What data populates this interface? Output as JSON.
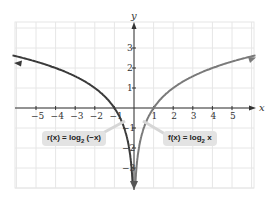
{
  "chart_data": {
    "type": "line",
    "title": "",
    "xlabel": "x",
    "ylabel": "y",
    "xlim": [
      -5.5,
      6
    ],
    "ylim": [
      -4,
      4.3
    ],
    "grid": true,
    "x_ticks": [
      -5,
      -4,
      -3,
      -2,
      -1,
      1,
      2,
      3,
      4,
      5
    ],
    "y_ticks": [
      -3,
      -2,
      -1,
      1,
      2,
      3
    ],
    "series": [
      {
        "name": "r(x) = log2(-x)",
        "label_text": "r(x) = log",
        "label_base": "2",
        "label_arg": " (−x)",
        "color": "#3a3a3a",
        "x": [
          -6.2,
          -5,
          -4,
          -3,
          -2,
          -1,
          -0.5,
          -0.25,
          -0.125,
          -0.08
        ],
        "y": [
          2.63,
          2.32,
          2.0,
          1.58,
          1.0,
          0.0,
          -1.0,
          -2.0,
          -3.0,
          -3.64
        ]
      },
      {
        "name": "f(x) = log2 x",
        "label_text": "f(x) = log",
        "label_base": "2",
        "label_arg": " x",
        "color": "#7a7a7a",
        "x": [
          0.08,
          0.125,
          0.25,
          0.5,
          1,
          2,
          3,
          4,
          5,
          6.2
        ],
        "y": [
          -3.64,
          -3.0,
          -2.0,
          -1.0,
          0.0,
          1.0,
          1.58,
          2.0,
          2.32,
          2.63
        ]
      }
    ]
  }
}
